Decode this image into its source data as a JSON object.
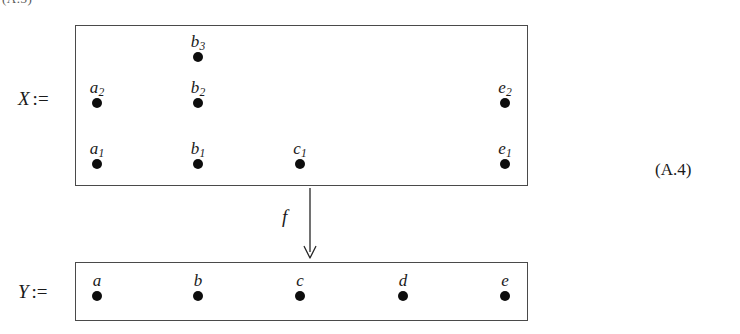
{
  "figure": {
    "equation_number": "(A.4)",
    "top_cutoff_text": "(A.3)",
    "assign_symbol": ":=",
    "map_label": "f",
    "map_direction": "down",
    "domain": {
      "name": "X",
      "label": "X",
      "elements": [
        {
          "id": "b3",
          "base": "b",
          "sub": "3",
          "x": 198,
          "y": 57
        },
        {
          "id": "a2",
          "base": "a",
          "sub": "2",
          "x": 97,
          "y": 103
        },
        {
          "id": "b2",
          "base": "b",
          "sub": "2",
          "x": 198,
          "y": 103
        },
        {
          "id": "e2",
          "base": "e",
          "sub": "2",
          "x": 505,
          "y": 103
        },
        {
          "id": "a1",
          "base": "a",
          "sub": "1",
          "x": 97,
          "y": 164
        },
        {
          "id": "b1",
          "base": "b",
          "sub": "1",
          "x": 198,
          "y": 164
        },
        {
          "id": "c1",
          "base": "c",
          "sub": "1",
          "x": 300,
          "y": 164
        },
        {
          "id": "e1",
          "base": "e",
          "sub": "1",
          "x": 505,
          "y": 164
        }
      ]
    },
    "codomain": {
      "name": "Y",
      "label": "Y",
      "elements": [
        {
          "id": "a",
          "base": "a",
          "sub": "",
          "x": 97,
          "y": 296
        },
        {
          "id": "b",
          "base": "b",
          "sub": "",
          "x": 198,
          "y": 296
        },
        {
          "id": "c",
          "base": "c",
          "sub": "",
          "x": 300,
          "y": 296
        },
        {
          "id": "d",
          "base": "d",
          "sub": "",
          "x": 403,
          "y": 296
        },
        {
          "id": "e",
          "base": "e",
          "sub": "",
          "x": 505,
          "y": 296
        }
      ]
    },
    "colors": {
      "ink": "#1a1a1a",
      "dot": "#0d0d0d",
      "box_border": "#4a4a4a",
      "background": "#ffffff"
    }
  }
}
